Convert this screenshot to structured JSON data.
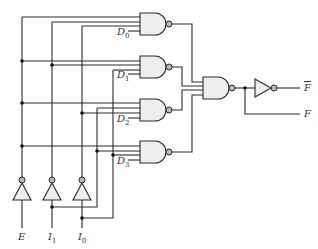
{
  "diagram": {
    "inputs": [
      {
        "id": "E",
        "label": "E",
        "sub": ""
      },
      {
        "id": "I1",
        "label": "I",
        "sub": "1"
      },
      {
        "id": "I0",
        "label": "I",
        "sub": "0"
      }
    ],
    "decoder_gates": [
      {
        "id": "G0",
        "data_label": "D",
        "data_sub": "0",
        "inputs": [
          "E",
          "I1'",
          "I0'",
          "D0"
        ]
      },
      {
        "id": "G1",
        "data_label": "D",
        "data_sub": "1",
        "inputs": [
          "E",
          "I1'",
          "I0",
          "D1"
        ]
      },
      {
        "id": "G2",
        "data_label": "D",
        "data_sub": "2",
        "inputs": [
          "E",
          "I1",
          "I0'",
          "D2"
        ]
      },
      {
        "id": "G3",
        "data_label": "D",
        "data_sub": "3",
        "inputs": [
          "E",
          "I1",
          "I0",
          "D3"
        ]
      }
    ],
    "outputs": [
      {
        "id": "Fbar",
        "label": "F",
        "overline": true
      },
      {
        "id": "F",
        "label": "F",
        "overline": false
      }
    ],
    "colors": {
      "wire": "#2b2b2b",
      "gate_fill": "#eeeeee",
      "bubble": "#b8b8b8"
    }
  }
}
